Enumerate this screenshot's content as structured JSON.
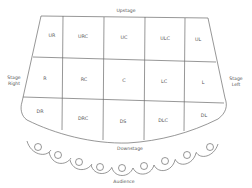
{
  "diagram": {
    "labels": {
      "upstage": "Upstage",
      "downstage": "Downstage",
      "stage_right": [
        "Stage",
        "Right"
      ],
      "stage_left": [
        "Stage",
        "Left"
      ],
      "audience": "Audience"
    },
    "rows": [
      {
        "name": "upstage-row",
        "cells": [
          "UR",
          "URC",
          "UC",
          "ULC",
          "UL"
        ]
      },
      {
        "name": "center-row",
        "cells": [
          "R",
          "RC",
          "C",
          "LC",
          "L"
        ]
      },
      {
        "name": "downstage-row",
        "cells": [
          "DR",
          "DRC",
          "DS",
          "DLC",
          "DL"
        ]
      }
    ],
    "audience_seat_count": 9,
    "colors": {
      "line": "#6a6a6a",
      "text": "#555555",
      "background": "#ffffff"
    }
  }
}
